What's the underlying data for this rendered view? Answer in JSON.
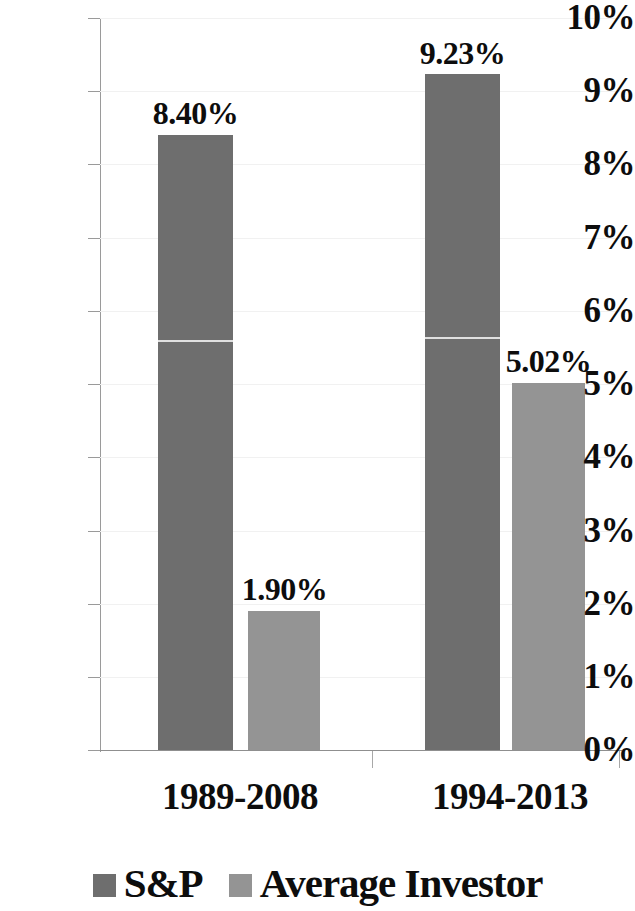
{
  "chart_data": {
    "type": "bar",
    "title": "",
    "subtitle": "",
    "xlabel": "",
    "ylabel": "",
    "categories": [
      "1989-2008",
      "1994-2013"
    ],
    "series": [
      {
        "name": "S&P",
        "color": "#6e6e6e",
        "values": [
          8.4,
          9.23
        ],
        "labels": [
          "8.40%",
          "9.23%"
        ]
      },
      {
        "name": "Average Investor",
        "color": "#949494",
        "values": [
          1.9,
          5.02
        ],
        "labels": [
          "1.90%",
          "5.02%"
        ]
      }
    ],
    "ylim": [
      0,
      10
    ],
    "ytick_values": [
      0,
      1,
      2,
      3,
      4,
      5,
      6,
      7,
      8,
      9,
      10
    ],
    "ytick_labels": [
      "0%",
      "1%",
      "2%",
      "3%",
      "4%",
      "5%",
      "6%",
      "7%",
      "8%",
      "9%",
      "10%"
    ],
    "grid": true,
    "legend_position": "bottom",
    "value_unit": "percent"
  },
  "legend": {
    "items": [
      {
        "label": "S&P",
        "color": "#6e6e6e"
      },
      {
        "label": "Average Investor",
        "color": "#949494"
      }
    ]
  }
}
